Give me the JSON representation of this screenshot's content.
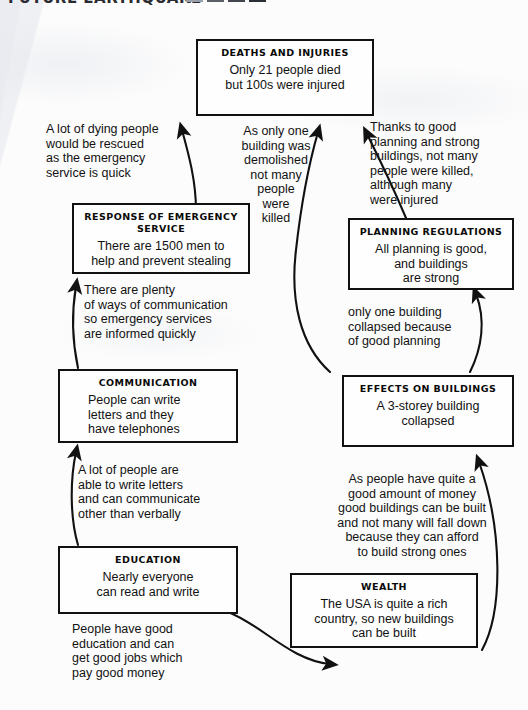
{
  "page": {
    "header_partial_text": "FUTURE EARTHQUAKE",
    "header_block_color": "#3a3d44",
    "ink_color": "#111111",
    "paper_color": "#fcfcfc",
    "width": 528,
    "height": 710
  },
  "diagram": {
    "type": "causal-flow-chart",
    "nodes": [
      {
        "id": "deaths-and-injuries",
        "title": "DEATHS AND INJURIES",
        "body": "Only 21 people died\nbut 100s were injured"
      },
      {
        "id": "response-of-emergency-service",
        "title": "RESPONSE OF EMERGENCY\nSERVICE",
        "body": "There are 1500 men to\nhelp and prevent stealing"
      },
      {
        "id": "planning-regulations",
        "title": "PLANNING REGULATIONS",
        "body": "All planning is good,\nand buildings\nare strong"
      },
      {
        "id": "communication",
        "title": "COMMUNICATION",
        "body": "People can write\nletters and they\nhave telephones"
      },
      {
        "id": "effects-on-buildings",
        "title": "EFFECTS ON BUILDINGS",
        "body": "A 3-storey building\ncollapsed"
      },
      {
        "id": "education",
        "title": "EDUCATION",
        "body": "Nearly everyone\ncan read and write"
      },
      {
        "id": "wealth",
        "title": "WEALTH",
        "body": "The USA is quite a rich\ncountry, so new buildings\ncan be built"
      }
    ],
    "edges": [
      {
        "id": "emergency-to-deaths",
        "from": "response-of-emergency-service",
        "to": "deaths-and-injuries",
        "label": "A lot of dying people\nwould be rescued\nas the emergency\nservice is quick"
      },
      {
        "id": "buildings-to-deaths",
        "from": "effects-on-buildings",
        "to": "deaths-and-injuries",
        "label": "As only one\nbuilding was\ndemolished\nnot many\npeople\nwere\nkilled"
      },
      {
        "id": "planning-to-deaths",
        "from": "planning-regulations",
        "to": "deaths-and-injuries",
        "label": "Thanks to good\nplanning and strong\nbuildings, not many\npeople were killed,\nalthough many\nwere injured"
      },
      {
        "id": "communication-to-emergency",
        "from": "communication",
        "to": "response-of-emergency-service",
        "label": "There are plenty\nof ways of communication\nso emergency services\nare informed quickly"
      },
      {
        "id": "buildings-to-planning",
        "from": "effects-on-buildings",
        "to": "planning-regulations",
        "label": "only one building\ncollapsed because\nof good planning"
      },
      {
        "id": "education-to-communication",
        "from": "education",
        "to": "communication",
        "label": "A lot of people are\nable to write letters\nand can communicate\nother than verbally"
      },
      {
        "id": "wealth-to-buildings",
        "from": "wealth",
        "to": "effects-on-buildings",
        "label": "As  people have quite a\ngood amount of money\ngood buildings can be built\nand not many will fall down\nbecause they can afford\nto build strong ones"
      },
      {
        "id": "education-to-wealth",
        "from": "education",
        "to": "wealth",
        "label": "People have good\neducation and can\nget good jobs which\npay good money"
      }
    ]
  }
}
